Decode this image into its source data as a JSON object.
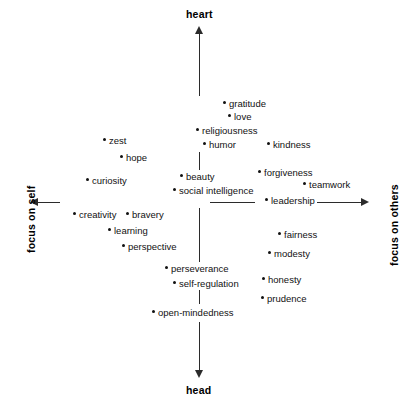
{
  "chart_data": {
    "type": "scatter",
    "title": "",
    "subtitle": "",
    "xlabel": "",
    "ylabel": "",
    "grid": false,
    "legend": "none",
    "axes": {
      "vertical": {
        "top_label": "heart",
        "bottom_label": "head",
        "orientation": "vertical",
        "arrows": "both"
      },
      "horizontal": {
        "left_label": "focus on self",
        "right_label": "focus on others",
        "orientation": "horizontal",
        "arrows": "both"
      }
    },
    "xlim": [
      -1,
      1
    ],
    "ylim": [
      -1,
      1
    ],
    "point_marker": "bullet",
    "points": [
      {
        "label": "gratitude",
        "x": 0.15,
        "y": 0.58,
        "px": 223,
        "py": 103,
        "anchor": "left"
      },
      {
        "label": "love",
        "x": 0.18,
        "y": 0.51,
        "px": 228,
        "py": 116,
        "anchor": "left"
      },
      {
        "label": "religiousness",
        "x": -0.02,
        "y": 0.43,
        "px": 196,
        "py": 130,
        "anchor": "left"
      },
      {
        "label": "humor",
        "x": 0.02,
        "y": 0.35,
        "px": 203,
        "py": 144,
        "anchor": "left"
      },
      {
        "label": "kindness",
        "x": 0.4,
        "y": 0.35,
        "px": 267,
        "py": 144,
        "anchor": "left"
      },
      {
        "label": "zest",
        "x": -0.56,
        "y": 0.4,
        "px": 103,
        "py": 140,
        "anchor": "left"
      },
      {
        "label": "hope",
        "x": -0.44,
        "y": 0.3,
        "px": 120,
        "py": 157,
        "anchor": "left"
      },
      {
        "label": "curiosity",
        "x": -0.64,
        "y": 0.16,
        "px": 86,
        "py": 180,
        "anchor": "left"
      },
      {
        "label": "beauty",
        "x": -0.08,
        "y": 0.18,
        "px": 180,
        "py": 176,
        "anchor": "left"
      },
      {
        "label": "forgiveness",
        "x": 0.33,
        "y": 0.18,
        "px": 258,
        "py": 172,
        "anchor": "left"
      },
      {
        "label": "social intelligence",
        "x": -0.12,
        "y": 0.09,
        "px": 173,
        "py": 190,
        "anchor": "left"
      },
      {
        "label": "teamwork",
        "x": 0.54,
        "y": 0.09,
        "px": 303,
        "py": 184,
        "anchor": "left"
      },
      {
        "label": "leadership",
        "x": 0.37,
        "y": 0.0,
        "px": 265,
        "py": 200,
        "anchor": "left"
      },
      {
        "label": "creativity",
        "x": -0.72,
        "y": -0.08,
        "px": 73,
        "py": 214,
        "anchor": "left"
      },
      {
        "label": "bravery",
        "x": -0.42,
        "y": -0.08,
        "px": 126,
        "py": 214,
        "anchor": "left"
      },
      {
        "label": "learning",
        "x": -0.52,
        "y": -0.16,
        "px": 108,
        "py": 230,
        "anchor": "left"
      },
      {
        "label": "perspective",
        "x": -0.44,
        "y": -0.24,
        "px": 122,
        "py": 246,
        "anchor": "left"
      },
      {
        "label": "fairness",
        "x": 0.47,
        "y": -0.2,
        "px": 278,
        "py": 234,
        "anchor": "left"
      },
      {
        "label": "modesty",
        "x": 0.4,
        "y": -0.29,
        "px": 268,
        "py": 253,
        "anchor": "left"
      },
      {
        "label": "perseverance",
        "x": -0.18,
        "y": -0.37,
        "px": 165,
        "py": 268,
        "anchor": "left"
      },
      {
        "label": "self-regulation",
        "x": -0.12,
        "y": -0.44,
        "px": 173,
        "py": 283,
        "anchor": "left"
      },
      {
        "label": "honesty",
        "x": 0.34,
        "y": -0.42,
        "px": 262,
        "py": 279,
        "anchor": "left"
      },
      {
        "label": "prudence",
        "x": 0.33,
        "y": -0.51,
        "px": 261,
        "py": 298,
        "anchor": "left"
      },
      {
        "label": "open-mindedness",
        "x": -0.26,
        "y": -0.58,
        "px": 152,
        "py": 312,
        "anchor": "left"
      }
    ]
  }
}
